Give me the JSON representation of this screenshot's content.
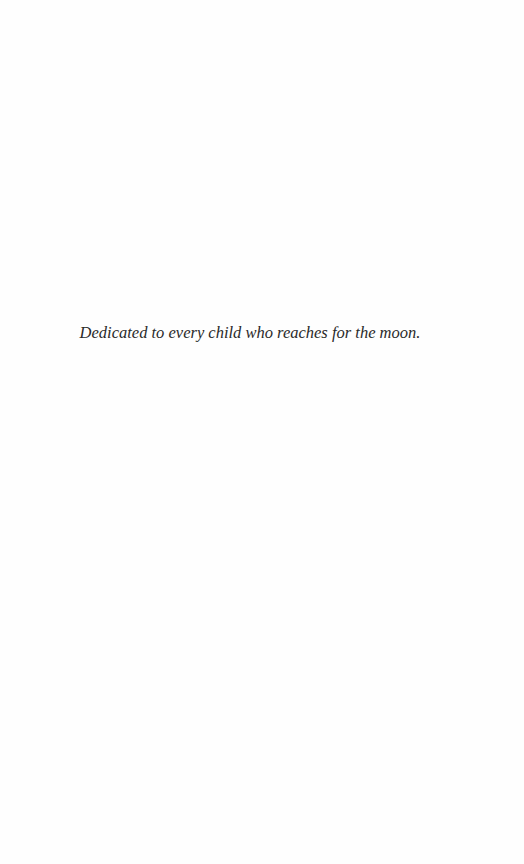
{
  "page": {
    "dedication": "Dedicated to every child who reaches for the moon."
  }
}
